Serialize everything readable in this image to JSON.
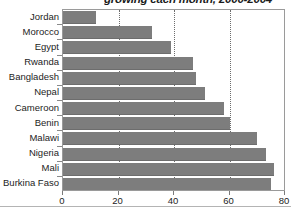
{
  "chart_data": {
    "type": "bar",
    "orientation": "horizontal",
    "title": "growing each month, 2000-2004",
    "xlabel": "",
    "ylabel": "",
    "xlim": [
      0,
      80
    ],
    "xticks": [
      0,
      20,
      40,
      60,
      80
    ],
    "grid": true,
    "legend": false,
    "bar_color": "#7d7d7d",
    "categories": [
      "Jordan",
      "Morocco",
      "Egypt",
      "Rwanda",
      "Bangladesh",
      "Nepal",
      "Cameroon",
      "Benin",
      "Malawi",
      "Nigeria",
      "Mali",
      "Burkina Faso"
    ],
    "values": [
      12,
      32,
      39,
      47,
      48,
      51,
      58,
      60,
      70,
      73,
      76,
      75
    ]
  }
}
